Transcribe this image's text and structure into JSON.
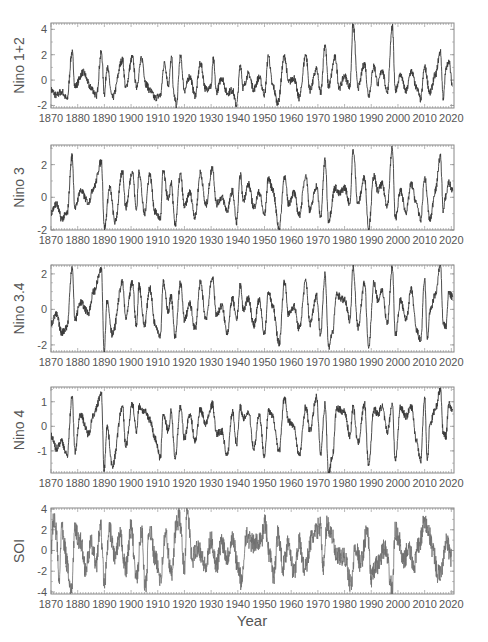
{
  "figure": {
    "xlabel": "Year",
    "x_ticks": [
      "1870",
      "1880",
      "1890",
      "1900",
      "1910",
      "1920",
      "1930",
      "1940",
      "1950",
      "1960",
      "1970",
      "1980",
      "1990",
      "2000",
      "2010",
      "2020"
    ],
    "x_range": [
      1870,
      2021
    ],
    "line_color": "#3a3a3a",
    "soi_line_color": "#6e6e6e",
    "frame_color": "#888888"
  },
  "chart_data": [
    {
      "type": "line",
      "title": "",
      "ylabel": "Nino 1+2",
      "xlabel": "",
      "ylim": [
        -2.2,
        4.5
      ],
      "y_ticks": [
        "4",
        "2",
        "0",
        "-2"
      ],
      "y_tick_values": [
        4,
        2,
        0,
        -2
      ],
      "x": [
        1870,
        1872,
        1874,
        1876,
        1877.9,
        1879,
        1882,
        1885,
        1887,
        1888.9,
        1890,
        1891,
        1893,
        1896.8,
        1898,
        1900.5,
        1902,
        1904,
        1905.6,
        1907,
        1909,
        1911,
        1912.5,
        1914,
        1915.2,
        1916,
        1917,
        1918.5,
        1920,
        1922,
        1924,
        1926,
        1928,
        1930,
        1930.8,
        1932,
        1934,
        1936,
        1938,
        1939.5,
        1941,
        1942,
        1944,
        1946,
        1948,
        1950,
        1951.5,
        1953,
        1955,
        1957.5,
        1959,
        1961,
        1963,
        1965.5,
        1967,
        1969.5,
        1971,
        1972.7,
        1974,
        1976.5,
        1978,
        1980,
        1982,
        1983.2,
        1985,
        1987.5,
        1989,
        1991,
        1992.5,
        1994,
        1996,
        1997.9,
        1999,
        2001,
        2003,
        2005,
        2007,
        2008.5,
        2010,
        2012,
        2014,
        2015.9,
        2017,
        2018,
        2019,
        2020.5
      ],
      "values": [
        -0.8,
        -1.2,
        -0.9,
        -1.5,
        2.2,
        -0.5,
        0.6,
        -0.6,
        -1.2,
        2.2,
        -1.1,
        1.0,
        -1.4,
        1.6,
        -0.6,
        1.8,
        -0.5,
        1.7,
        -0.3,
        -0.8,
        -1.4,
        -1.2,
        1.4,
        -0.4,
        1.8,
        -1.1,
        -2.0,
        1.9,
        -0.8,
        0.3,
        -1.2,
        1.3,
        -0.7,
        -0.5,
        1.6,
        -0.9,
        0.2,
        -1.0,
        -0.8,
        -2.0,
        1.2,
        -0.6,
        0.5,
        -0.7,
        0.2,
        -1.1,
        1.9,
        -0.4,
        -1.8,
        1.9,
        -0.2,
        0.2,
        -1.4,
        2.0,
        -0.8,
        0.8,
        -1.0,
        2.8,
        -0.5,
        1.8,
        -0.6,
        0.3,
        -0.5,
        4.4,
        -0.6,
        1.3,
        -1.2,
        1.1,
        -0.3,
        0.8,
        -0.9,
        4.2,
        -0.8,
        0.4,
        -0.9,
        0.7,
        -0.6,
        -1.5,
        1.0,
        -1.0,
        0.4,
        2.2,
        -1.4,
        0.8,
        1.6,
        -0.5
      ]
    },
    {
      "type": "line",
      "title": "",
      "ylabel": "Nino 3",
      "xlabel": "",
      "ylim": [
        -2.0,
        3.2
      ],
      "y_ticks": [
        "2",
        "0",
        "-2"
      ],
      "y_tick_values": [
        2,
        0,
        -2
      ],
      "x": [
        1870,
        1872,
        1874,
        1876,
        1877.9,
        1879,
        1881,
        1884,
        1886,
        1888.9,
        1890,
        1892,
        1894,
        1896.8,
        1898,
        1900.5,
        1902,
        1903,
        1905,
        1907,
        1909,
        1911,
        1912,
        1914,
        1915,
        1916.5,
        1918.5,
        1920,
        1922,
        1924,
        1926,
        1928,
        1930.5,
        1932,
        1934,
        1936,
        1938,
        1939.5,
        1941,
        1942,
        1944,
        1946,
        1948,
        1950,
        1951.5,
        1953,
        1955.5,
        1957.5,
        1959,
        1961,
        1963,
        1965.5,
        1967,
        1969.5,
        1971,
        1972.7,
        1974,
        1976.5,
        1978,
        1980,
        1982,
        1983.2,
        1985,
        1987.5,
        1989,
        1991,
        1992.5,
        1994,
        1996,
        1997.9,
        1999,
        2001,
        2003,
        2005,
        2007,
        2008.5,
        2010,
        2012,
        2014,
        2015.9,
        2017,
        2018,
        2019,
        2020.5
      ],
      "values": [
        -0.9,
        -0.4,
        -1.3,
        -1.0,
        2.5,
        -0.7,
        0.4,
        -0.3,
        0.6,
        2.2,
        -1.9,
        0.6,
        -1.5,
        1.6,
        -0.6,
        1.6,
        -0.8,
        1.6,
        -1.0,
        1.4,
        -0.9,
        -1.3,
        1.6,
        -0.2,
        0.9,
        -1.7,
        1.4,
        -0.6,
        0.3,
        -1.2,
        1.5,
        -0.5,
        1.8,
        -0.4,
        0.0,
        -0.8,
        0.4,
        -1.5,
        1.4,
        -0.2,
        0.8,
        -0.6,
        0.3,
        -1.1,
        1.2,
        0.5,
        -1.9,
        1.3,
        -0.4,
        0.3,
        -1.1,
        1.4,
        -0.8,
        0.7,
        -1.2,
        2.3,
        -1.4,
        0.6,
        0.2,
        0.6,
        -0.4,
        2.9,
        -0.4,
        1.2,
        -1.9,
        1.3,
        0.4,
        0.8,
        -0.5,
        3.0,
        -1.3,
        0.4,
        -0.9,
        0.8,
        -0.4,
        -1.4,
        1.2,
        -1.4,
        0.4,
        2.5,
        -0.8,
        0.1,
        0.9,
        0.4
      ]
    },
    {
      "type": "line",
      "title": "",
      "ylabel": "Nino 3.4",
      "xlabel": "",
      "ylim": [
        -2.4,
        2.5
      ],
      "y_ticks": [
        "2",
        "0",
        "-2"
      ],
      "y_tick_values": [
        2,
        0,
        -2
      ],
      "x": [
        1870,
        1872,
        1874,
        1876,
        1877.9,
        1879,
        1881,
        1884,
        1886,
        1888.9,
        1889.9,
        1891,
        1893,
        1896.8,
        1898,
        1900.5,
        1902,
        1903,
        1905,
        1907,
        1909,
        1911,
        1912,
        1914,
        1915,
        1916.5,
        1918.5,
        1920,
        1922,
        1924,
        1926,
        1928,
        1930.5,
        1932,
        1934,
        1936,
        1938,
        1939.5,
        1941,
        1942,
        1944,
        1946,
        1948,
        1950,
        1951.5,
        1953,
        1955.5,
        1957.5,
        1959,
        1961,
        1963,
        1965.5,
        1967,
        1969.5,
        1971,
        1972.7,
        1974,
        1975.5,
        1977,
        1980,
        1982,
        1983.2,
        1985,
        1987.5,
        1989,
        1991,
        1992.5,
        1994,
        1996,
        1997.9,
        1999,
        2001,
        2003,
        2005,
        2007,
        2008.5,
        2010,
        2011,
        2012,
        2014,
        2015.9,
        2017,
        2018,
        2019,
        2020.5
      ],
      "values": [
        -0.8,
        -0.3,
        -1.3,
        -1.0,
        2.4,
        -0.6,
        0.4,
        -0.2,
        1.0,
        2.2,
        -2.4,
        0.5,
        -1.4,
        1.5,
        -0.5,
        1.5,
        -1.0,
        1.4,
        -0.9,
        1.2,
        -0.8,
        -1.5,
        1.5,
        -0.1,
        0.8,
        -1.6,
        1.5,
        -0.6,
        0.3,
        -1.1,
        1.5,
        -0.5,
        1.8,
        -0.3,
        0.2,
        -1.3,
        0.6,
        -0.6,
        1.4,
        0.0,
        0.6,
        -0.9,
        0.5,
        -1.4,
        1.0,
        0.2,
        -1.9,
        1.6,
        -0.3,
        0.2,
        -1.1,
        1.6,
        -0.8,
        0.8,
        -1.4,
        2.0,
        -2.1,
        -1.3,
        0.8,
        0.5,
        -0.6,
        2.4,
        -1.0,
        1.5,
        -2.2,
        1.5,
        0.5,
        1.1,
        -0.8,
        2.4,
        -1.5,
        0.5,
        -0.6,
        1.1,
        -1.2,
        -1.8,
        1.7,
        -1.7,
        -0.1,
        0.8,
        2.5,
        -0.8,
        -1.0,
        0.9,
        0.7
      ]
    },
    {
      "type": "line",
      "title": "",
      "ylabel": "Nino 4",
      "xlabel": "",
      "ylim": [
        -1.9,
        1.6
      ],
      "y_ticks": [
        "1",
        "0",
        "-1"
      ],
      "y_tick_values": [
        1,
        0,
        -1
      ],
      "x": [
        1870,
        1872,
        1874,
        1876,
        1877.9,
        1879,
        1881,
        1884,
        1886,
        1888.9,
        1889.9,
        1891,
        1893,
        1896.8,
        1898,
        1900.5,
        1902,
        1903,
        1905,
        1907,
        1909,
        1911,
        1912,
        1914,
        1915,
        1916.5,
        1918.5,
        1920,
        1922,
        1924,
        1926,
        1928,
        1930.5,
        1932,
        1934,
        1936,
        1938,
        1939.5,
        1941,
        1942,
        1944,
        1946,
        1948,
        1950,
        1951.5,
        1953,
        1955.5,
        1957.5,
        1959,
        1961,
        1963,
        1965.5,
        1967,
        1969.5,
        1971,
        1972.7,
        1974,
        1975.5,
        1977,
        1980,
        1982,
        1983.2,
        1985,
        1987.5,
        1989,
        1991,
        1992.5,
        1994,
        1996,
        1997.9,
        1999,
        2001,
        2003,
        2005,
        2007,
        2008.5,
        2010,
        2011,
        2012,
        2014,
        2015.9,
        2017,
        2018,
        2019,
        2020.5
      ],
      "values": [
        -0.4,
        -0.9,
        -0.6,
        -1.2,
        1.2,
        -1.0,
        0.5,
        -0.3,
        0.5,
        1.3,
        -1.8,
        0.0,
        -1.6,
        0.8,
        -0.8,
        0.9,
        -0.2,
        0.8,
        0.6,
        0.3,
        -0.5,
        -1.3,
        0.5,
        -0.2,
        0.6,
        -1.3,
        0.8,
        -0.5,
        0.5,
        -0.6,
        0.7,
        0.1,
        0.9,
        -0.3,
        -0.2,
        -1.2,
        0.6,
        -0.7,
        0.8,
        0.3,
        0.6,
        -0.9,
        0.5,
        -1.2,
        0.6,
        0.4,
        -1.0,
        1.2,
        0.2,
        0.0,
        -1.2,
        0.8,
        -0.2,
        1.2,
        -1.1,
        0.9,
        -1.9,
        -1.2,
        0.7,
        0.6,
        -0.4,
        0.8,
        -0.7,
        0.9,
        -1.6,
        0.7,
        0.5,
        0.8,
        -0.2,
        0.9,
        -1.4,
        0.8,
        0.4,
        0.8,
        -0.6,
        -1.4,
        1.2,
        -1.4,
        0.1,
        0.7,
        1.5,
        -0.3,
        -0.4,
        0.9,
        0.7
      ]
    },
    {
      "type": "line",
      "title": "",
      "ylabel": "SOI",
      "xlabel": "Year",
      "ylim": [
        -4.2,
        4.1
      ],
      "y_ticks": [
        "4",
        "2",
        "0",
        "-2",
        "-4"
      ],
      "y_tick_values": [
        4,
        2,
        0,
        -2,
        -4
      ],
      "x": [
        1870,
        1871,
        1872,
        1873,
        1874,
        1875,
        1876,
        1877.6,
        1879,
        1881,
        1883,
        1885,
        1887,
        1888.5,
        1890,
        1892,
        1894,
        1896,
        1898,
        1900,
        1902,
        1904,
        1905.3,
        1907,
        1909,
        1911,
        1913,
        1915,
        1917,
        1918,
        1920,
        1921,
        1923,
        1925,
        1928,
        1930,
        1932,
        1934,
        1936,
        1938,
        1940,
        1941.5,
        1943,
        1946,
        1949,
        1950,
        1952,
        1953.5,
        1955,
        1957,
        1959,
        1961,
        1963,
        1965,
        1968,
        1971,
        1972,
        1973.5,
        1975,
        1977,
        1980,
        1982.5,
        1984,
        1986,
        1988.5,
        1990,
        1992,
        1995,
        1997.9,
        1999,
        2000,
        2002,
        2004,
        2006,
        2008,
        2010,
        2011,
        2013,
        2015,
        2016,
        2018,
        2020
      ],
      "values": [
        0.2,
        2.9,
        1.8,
        -3.1,
        2.2,
        0.5,
        -1.2,
        -4.1,
        1.9,
        0.9,
        -1.7,
        0.6,
        -1.2,
        2.4,
        -3.0,
        1.9,
        -0.6,
        1.3,
        -1.8,
        2.2,
        -2.8,
        1.9,
        -3.6,
        2.1,
        -0.8,
        -2.5,
        1.5,
        -2.3,
        2.4,
        3.2,
        -1.6,
        3.8,
        -0.8,
        0.4,
        -1.6,
        1.0,
        -1.4,
        0.9,
        -0.6,
        1.3,
        -1.4,
        -3.2,
        1.4,
        0.6,
        1.2,
        2.7,
        -0.4,
        -2.6,
        1.6,
        -1.5,
        0.9,
        -2.2,
        0.8,
        -1.8,
        1.3,
        2.4,
        -1.8,
        2.6,
        1.6,
        -0.7,
        -0.6,
        -3.3,
        0.4,
        -1.2,
        1.9,
        -2.6,
        -1.5,
        0.2,
        -3.6,
        2.0,
        1.4,
        -1.1,
        0.2,
        -1.4,
        0.6,
        2.8,
        2.2,
        0.3,
        -2.3,
        -2.1,
        0.9,
        -0.6
      ]
    }
  ]
}
